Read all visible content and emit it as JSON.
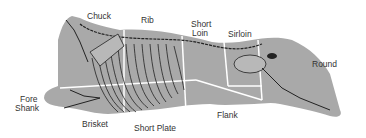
{
  "colors": {
    "body": "#a9a9a9",
    "bone": "#b8b8b8",
    "bone_outline": "#222222",
    "cut_line": "#ffffff",
    "text": "#333333"
  },
  "labels": {
    "chuck": "Chuck",
    "rib": "Rib",
    "short_loin_1": "Short",
    "short_loin_2": "Loin",
    "sirloin": "Sirloin",
    "round": "Round",
    "fore_shank_1": "Fore",
    "fore_shank_2": "Shank",
    "brisket": "Brisket",
    "short_plate": "Short Plate",
    "flank": "Flank"
  }
}
